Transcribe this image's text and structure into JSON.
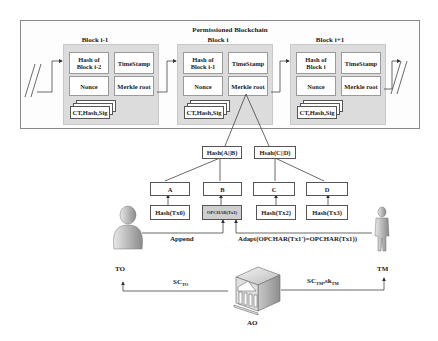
{
  "blockchain": {
    "title": "Permissioned Blockchain",
    "blocks": [
      {
        "label": "Block i-1",
        "hash_prev": "Hash of Block i-2",
        "timestamp": "TimeStamp",
        "nonce": "Nonce",
        "merkle": "Merkle root",
        "tx": "CT,Hash,Sig"
      },
      {
        "label": "Block i",
        "hash_prev": "Hash of Block i-1",
        "timestamp": "TimeStamp",
        "nonce": "Nonce",
        "merkle": "Merkle root",
        "tx": "CT,Hash,Sig"
      },
      {
        "label": "Block i+1",
        "hash_prev": "Hash of Block i",
        "timestamp": "TimeStamp",
        "nonce": "Nonce",
        "merkle": "Merkle root",
        "tx": "CT,Hash,Sig"
      }
    ]
  },
  "merkle_tree": {
    "level1": [
      "Hash(A||B)",
      "Hsah(C||D)"
    ],
    "level2": [
      "A",
      "B",
      "C",
      "D"
    ],
    "leaves": [
      "Hash(Tx0)",
      "OPCHAR(Tx1)",
      "Hash(Tx2)",
      "Hash(Tx3)"
    ]
  },
  "actors": {
    "to": "TO",
    "tm": "TM",
    "ao": "AO"
  },
  "edges": {
    "append": "Append",
    "adapt": "Adapt(OPCHAR(Tx1')=OPCHAR(Tx1))",
    "sc_to_main": "SC",
    "sc_to_sub": "TO",
    "sc_tm_main": "SC",
    "sc_tm_sub": "TM",
    "sk_tm_main": ",sk",
    "sk_tm_sub": "TM"
  },
  "colors": {
    "block_bg": "#dcdcdc",
    "highlight_leaf": "#cfcfcf",
    "line": "#444444"
  }
}
